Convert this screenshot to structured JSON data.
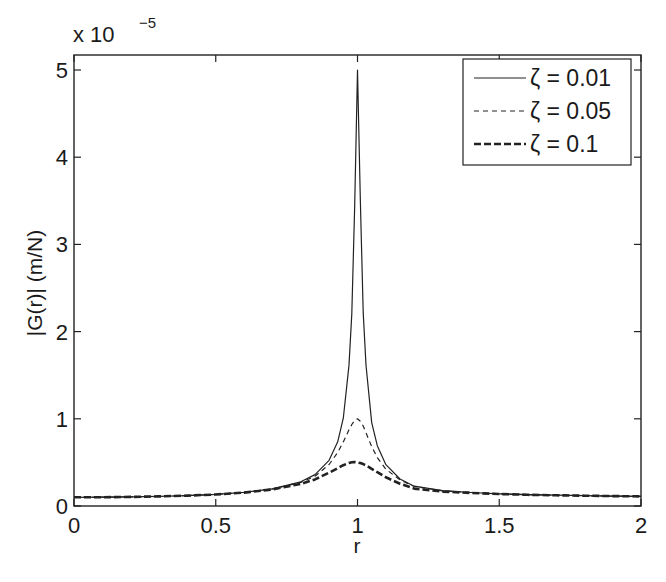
{
  "chart_data": {
    "type": "line",
    "title": "",
    "xlabel": "r",
    "ylabel": "|G(r)| (m/N)",
    "y_exponent_label": "x 10",
    "y_exponent_power": "−5",
    "xlim": [
      0,
      2
    ],
    "ylim": [
      0,
      5.2
    ],
    "y_scale": 1e-05,
    "grid": false,
    "legend_position": "upper right",
    "x_ticks": [
      0,
      0.5,
      1,
      1.5,
      2
    ],
    "x_tick_labels": [
      "0",
      "0.5",
      "1",
      "1.5",
      "2"
    ],
    "y_ticks": [
      0,
      1,
      2,
      3,
      4,
      5
    ],
    "y_tick_labels": [
      "0",
      "1",
      "2",
      "3",
      "4",
      "5"
    ],
    "x": [
      0,
      0.1,
      0.2,
      0.3,
      0.4,
      0.5,
      0.6,
      0.7,
      0.8,
      0.85,
      0.9,
      0.93,
      0.95,
      0.97,
      0.98,
      0.99,
      1.0,
      1.01,
      1.02,
      1.03,
      1.05,
      1.07,
      1.1,
      1.15,
      1.2,
      1.3,
      1.4,
      1.5,
      1.6,
      1.7,
      1.8,
      1.9,
      2.0
    ],
    "series": [
      {
        "name": "ζ = 0.01",
        "style": "solid",
        "width": 1.2,
        "values": [
          0.1,
          0.101,
          0.104,
          0.11,
          0.119,
          0.133,
          0.156,
          0.196,
          0.278,
          0.36,
          0.524,
          0.736,
          1.007,
          1.616,
          2.203,
          3.447,
          5.0,
          3.528,
          2.22,
          1.613,
          0.956,
          0.692,
          0.474,
          0.31,
          0.227,
          0.175,
          0.155,
          0.14,
          0.13,
          0.124,
          0.118,
          0.114,
          0.11
        ]
      },
      {
        "name": "ζ = 0.05",
        "style": "dashed-thin",
        "width": 1.2,
        "values": [
          0.1,
          0.101,
          0.104,
          0.11,
          0.119,
          0.133,
          0.156,
          0.195,
          0.271,
          0.342,
          0.476,
          0.614,
          0.735,
          0.874,
          0.935,
          0.983,
          1.0,
          0.973,
          0.917,
          0.84,
          0.681,
          0.555,
          0.422,
          0.298,
          0.224,
          0.174,
          0.155,
          0.14,
          0.13,
          0.124,
          0.118,
          0.114,
          0.11
        ]
      },
      {
        "name": "ζ = 0.1",
        "style": "dashed-thick",
        "width": 2.6,
        "values": [
          0.1,
          0.101,
          0.104,
          0.11,
          0.119,
          0.132,
          0.154,
          0.19,
          0.254,
          0.305,
          0.382,
          0.434,
          0.468,
          0.494,
          0.501,
          0.505,
          0.5,
          0.492,
          0.481,
          0.467,
          0.427,
          0.389,
          0.329,
          0.256,
          0.2,
          0.165,
          0.15,
          0.138,
          0.129,
          0.123,
          0.118,
          0.114,
          0.11
        ]
      }
    ]
  }
}
